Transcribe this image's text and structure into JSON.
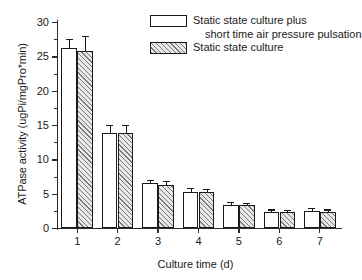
{
  "chart_data": {
    "type": "bar",
    "title": "",
    "xlabel": "Culture time (d)",
    "ylabel": "ATPase activity (ugPi/mgPro*min)",
    "categories": [
      "1",
      "2",
      "3",
      "4",
      "5",
      "6",
      "7"
    ],
    "ylim": [
      0,
      30
    ],
    "yticks": [
      0,
      5,
      10,
      15,
      20,
      25,
      30
    ],
    "ytick_labels": [
      "0",
      "5",
      "10",
      "15",
      "20",
      "25",
      "30"
    ],
    "grid": false,
    "legend_position": "top-right inside",
    "series": [
      {
        "name": "Static state culture plus short time air pressure pulsation",
        "fill": "open",
        "values": [
          26.2,
          13.8,
          6.5,
          5.3,
          3.4,
          2.4,
          2.5
        ],
        "errors": [
          1.2,
          1.0,
          0.4,
          0.35,
          0.25,
          0.15,
          0.2
        ]
      },
      {
        "name": "Static state culture",
        "fill": "hatched",
        "values": [
          25.8,
          13.8,
          6.3,
          5.2,
          3.3,
          2.4,
          2.4
        ],
        "errors": [
          2.0,
          1.1,
          0.35,
          0.3,
          0.15,
          0.1,
          0.15
        ]
      }
    ],
    "legend": [
      {
        "swatch": "open",
        "line1": "Static state culture plus",
        "line2": "short time air pressure pulsation"
      },
      {
        "swatch": "hatched",
        "line1": "Static state culture",
        "line2": ""
      }
    ]
  },
  "colors": {
    "axis": "#2b2b2b",
    "bar_edge": "#1a1a1a",
    "bar_open_fill": "#ffffff",
    "bar_hatch_fill": "#e8e8e8",
    "hatch_line": "#7a7a7a",
    "background": "#ffffff"
  }
}
